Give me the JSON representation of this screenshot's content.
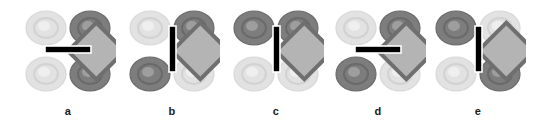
{
  "figure": {
    "kind": "orbital-overlap-diagram-series",
    "background_color": "#ffffff",
    "panel_count": 5,
    "colors": {
      "dark_lobe": "#7d7d7d",
      "dark_lobe_edge": "#6b6b6b",
      "dark_lobe_ring": "#6a6a6a",
      "dark_lobe_highlight": "#9e9e9e",
      "light_lobe": "#e2e2e2",
      "light_lobe_edge": "#d8d8d8",
      "light_lobe_ring": "#d2d2d2",
      "light_lobe_highlight": "#efefef",
      "core_square_fill": "#b4b4b4",
      "core_square_stroke": "#6f6f6f",
      "bar_fill": "#000000",
      "bar_outline": "#ffffff",
      "label_color": "#1a1a1a"
    },
    "panels": [
      {
        "id": "a",
        "label": "a",
        "center_x": 68,
        "bar_orientation": "horizontal",
        "dark_axis": "nw-se-pair-right",
        "lobes": [
          {
            "position": "top-left",
            "shade": "light"
          },
          {
            "position": "top-right",
            "shade": "dark"
          },
          {
            "position": "bottom-left",
            "shade": "light"
          },
          {
            "position": "bottom-right",
            "shade": "dark"
          }
        ]
      },
      {
        "id": "b",
        "label": "b",
        "center_x": 172,
        "bar_orientation": "vertical",
        "dark_axis": "sw-ne-diagonal",
        "lobes": [
          {
            "position": "top-left",
            "shade": "light"
          },
          {
            "position": "top-right",
            "shade": "dark"
          },
          {
            "position": "bottom-left",
            "shade": "dark"
          },
          {
            "position": "bottom-right",
            "shade": "light"
          }
        ]
      },
      {
        "id": "c",
        "label": "c",
        "center_x": 276,
        "bar_orientation": "vertical",
        "dark_axis": "top-pair",
        "lobes": [
          {
            "position": "top-left",
            "shade": "dark"
          },
          {
            "position": "top-right",
            "shade": "dark"
          },
          {
            "position": "bottom-left",
            "shade": "light"
          },
          {
            "position": "bottom-right",
            "shade": "light"
          }
        ]
      },
      {
        "id": "d",
        "label": "d",
        "center_x": 378,
        "bar_orientation": "horizontal",
        "dark_axis": "sw-ne-diagonal",
        "lobes": [
          {
            "position": "top-left",
            "shade": "light"
          },
          {
            "position": "top-right",
            "shade": "dark"
          },
          {
            "position": "bottom-left",
            "shade": "dark"
          },
          {
            "position": "bottom-right",
            "shade": "light"
          }
        ]
      },
      {
        "id": "e",
        "label": "e",
        "center_x": 478,
        "bar_orientation": "vertical",
        "dark_axis": "nw-se-diagonal",
        "lobes": [
          {
            "position": "top-left",
            "shade": "dark"
          },
          {
            "position": "top-right",
            "shade": "light"
          },
          {
            "position": "bottom-left",
            "shade": "light"
          },
          {
            "position": "bottom-right",
            "shade": "dark"
          }
        ]
      }
    ]
  }
}
